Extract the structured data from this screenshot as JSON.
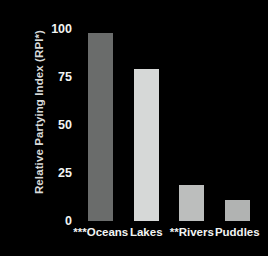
{
  "chart_data": {
    "type": "bar",
    "title": "",
    "xlabel": "",
    "ylabel": "Relative Partying Index (RPI*)",
    "categories": [
      "***Oceans",
      "Lakes",
      "**Rivers",
      "Puddles"
    ],
    "values": [
      98,
      79,
      19,
      11
    ],
    "ylim": [
      0,
      100
    ],
    "yticks": [
      0,
      25,
      50,
      75,
      100
    ],
    "ytick_labels": [
      "0",
      "25",
      "50",
      "75",
      "100"
    ],
    "grid": false,
    "legend": false,
    "bar_colors": [
      "#6a6c6b",
      "#d6d8d7",
      "#bcbebd",
      "#b1b3b2"
    ],
    "background_color": "#000000",
    "text_color": "#f2f4f3"
  },
  "axes": {
    "y_title": "Relative Partying Index (RPI*)",
    "y_ticks": [
      {
        "label": "100",
        "value": 100
      },
      {
        "label": "75",
        "value": 75
      },
      {
        "label": "50",
        "value": 50
      },
      {
        "label": "25",
        "value": 25
      },
      {
        "label": "0",
        "value": 0
      }
    ],
    "x_ticks": [
      {
        "label": "***Oceans"
      },
      {
        "label": "Lakes"
      },
      {
        "label": "**Rivers"
      },
      {
        "label": "Puddles"
      }
    ]
  }
}
